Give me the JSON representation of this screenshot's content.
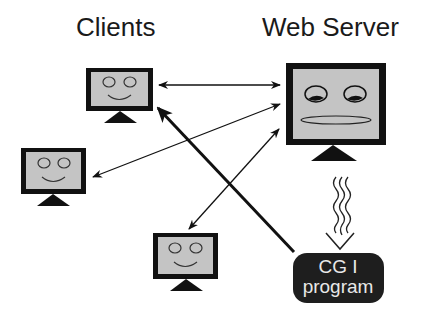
{
  "diagram": {
    "title_left": "Clients",
    "title_right": "Web Server",
    "cgi": {
      "line1": "CG I",
      "line2": "program"
    },
    "nodes": [
      {
        "id": "client-1",
        "type": "client-monitor",
        "face": "smiling"
      },
      {
        "id": "client-2",
        "type": "client-monitor",
        "face": "smiling"
      },
      {
        "id": "client-3",
        "type": "client-monitor",
        "face": "smiling"
      },
      {
        "id": "web-server",
        "type": "server-monitor",
        "face": "sleepy"
      },
      {
        "id": "cgi-program",
        "type": "rounded-box"
      }
    ],
    "edges": [
      {
        "from": "client-1",
        "to": "web-server",
        "style": "double-arrow thin"
      },
      {
        "from": "client-2",
        "to": "web-server",
        "style": "double-arrow thin"
      },
      {
        "from": "client-3",
        "to": "web-server",
        "style": "double-arrow thin"
      },
      {
        "from": "cgi-program",
        "to": "client-1",
        "style": "arrow thick"
      },
      {
        "from": "web-server",
        "to": "cgi-program",
        "style": "wavy triple arrow"
      }
    ],
    "colors": {
      "screen": "#c4c4c4",
      "frame": "#111111",
      "cgi_box": "#1e1e1e",
      "cgi_text": "#e8e8e8"
    }
  }
}
